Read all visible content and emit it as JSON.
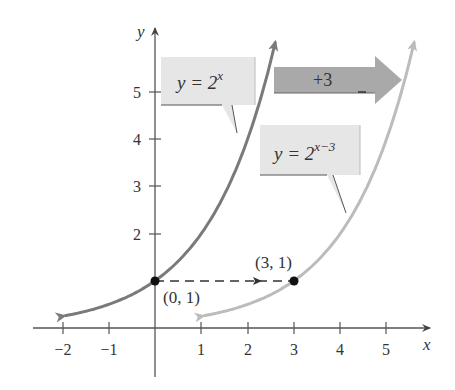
{
  "chart_data": {
    "type": "line",
    "title": "",
    "xlabel": "x",
    "ylabel": "y",
    "xlim": [
      -2.2,
      5.8
    ],
    "ylim": [
      -1,
      6
    ],
    "x_ticks": [
      "−2",
      "−1",
      "1",
      "2",
      "3",
      "4",
      "5"
    ],
    "y_ticks": [
      "2",
      "3",
      "4",
      "5"
    ],
    "series": [
      {
        "name": "y = 2^x",
        "color": "#7a7a7a",
        "x": [
          -2,
          -1,
          0,
          1,
          2,
          2.6
        ],
        "values": [
          0.25,
          0.5,
          1,
          2,
          4,
          6.06
        ]
      },
      {
        "name": "y = 2^(x-3)",
        "color": "#b8b8b8",
        "x": [
          1,
          2,
          3,
          4,
          5,
          5.6
        ],
        "values": [
          0.25,
          0.5,
          1,
          2,
          4,
          6.06
        ]
      }
    ],
    "annotations": [
      {
        "text": "(0, 1)",
        "x": 0,
        "y": 1
      },
      {
        "text": "(3, 1)",
        "x": 3,
        "y": 1
      },
      {
        "text": "+3",
        "type": "shift-arrow"
      }
    ],
    "grid": false,
    "legend": "callout boxes"
  },
  "labels": {
    "x_axis": "x",
    "y_axis": "y",
    "callout1_base": "y = 2",
    "callout1_exp": "x",
    "callout2_base": "y = 2",
    "callout2_exp": "x−3",
    "shift": "+3",
    "point1": "(0, 1)",
    "point2": "(3, 1)"
  },
  "ticks": {
    "x": [
      {
        "label": "−2",
        "px": 63
      },
      {
        "label": "−1",
        "px": 109
      },
      {
        "label": "1",
        "px": 201
      },
      {
        "label": "2",
        "px": 248
      },
      {
        "label": "3",
        "px": 294
      },
      {
        "label": "4",
        "px": 340
      },
      {
        "label": "5",
        "px": 386
      }
    ],
    "y": [
      {
        "label": "2",
        "py": 234
      },
      {
        "label": "3",
        "py": 186
      },
      {
        "label": "4",
        "py": 139
      },
      {
        "label": "5",
        "py": 92
      }
    ]
  },
  "colors": {
    "curve_original": "#7a7a7a",
    "curve_shifted": "#bcbcbc",
    "callout_fill": "#e6e6e6",
    "shift_arrow_fill": "#a9a9a9",
    "axis": "#444444"
  }
}
